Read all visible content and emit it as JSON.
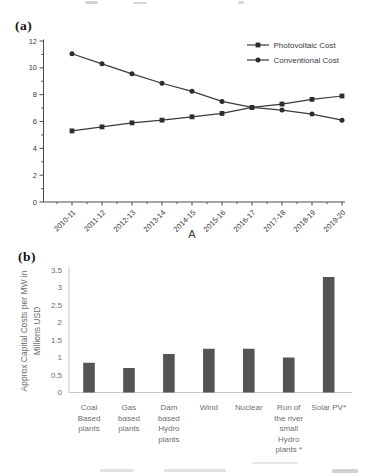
{
  "page": {
    "panel_a": "(a)",
    "panel_b": "(b)"
  },
  "colors": {
    "line": "#3a3a3a",
    "marker": "#2d2d2d",
    "axis_a": "#4a4a4a",
    "text_a": "#3a3a3a",
    "bar": "#545454",
    "text_b": "#6e6e6e",
    "axis_b": "#c9c9c9"
  },
  "chart_data": [
    {
      "id": "pv-vs-conventional-cost-line",
      "type": "line",
      "title": "",
      "xlabel": "A",
      "ylabel": "",
      "ylim": [
        0,
        12
      ],
      "yticks": [
        "0",
        "2",
        "4",
        "6",
        "8",
        "10",
        "12"
      ],
      "categories": [
        "2010-11",
        "2011-12",
        "2012-13",
        "2013-14",
        "2014-15",
        "2015-16",
        "2016-17",
        "2017-18",
        "2018-19",
        "2019-20"
      ],
      "series": [
        {
          "name": "Photovoltaic Cost",
          "marker": "square",
          "values": [
            5.3,
            5.6,
            5.9,
            6.1,
            6.35,
            6.6,
            7.05,
            7.3,
            7.65,
            7.9
          ]
        },
        {
          "name": "Conventional Cost",
          "marker": "circle",
          "values": [
            11.05,
            10.3,
            9.55,
            8.85,
            8.25,
            7.5,
            7.05,
            6.85,
            6.55,
            6.1
          ]
        }
      ],
      "legend_position": "top-right",
      "grid": false
    },
    {
      "id": "capital-costs-per-mw-bar",
      "type": "bar",
      "title": "",
      "xlabel": "",
      "ylabel": "Approx Capital Costs per MW in Millions USD",
      "ylabel_lines": [
        "Approx Capital Costs per MW in",
        "Millions USD"
      ],
      "ylim": [
        0,
        3.5
      ],
      "yticks": [
        "0",
        "0.5",
        "1",
        "1.5",
        "2",
        "2.5",
        "3",
        "3.5"
      ],
      "categories": [
        "Coal Based plants",
        "Gas based plants",
        "Dam based Hydro plants",
        "Wind",
        "Nuclear",
        "Run of the river small Hydro plants *",
        "Solar PV*"
      ],
      "categories_lines": [
        [
          "Coal",
          "Based",
          "plants"
        ],
        [
          "Gas",
          "based",
          "plants"
        ],
        [
          "Dam",
          "based",
          "Hydro",
          "plants"
        ],
        [
          "Wind"
        ],
        [
          "Nuclear"
        ],
        [
          "Run of",
          "the river",
          "small",
          "Hydro",
          "plants *"
        ],
        [
          "Solar PV*"
        ]
      ],
      "values": [
        0.85,
        0.7,
        1.1,
        1.25,
        1.25,
        1.0,
        3.3
      ],
      "legend_position": "none",
      "grid": false
    }
  ]
}
